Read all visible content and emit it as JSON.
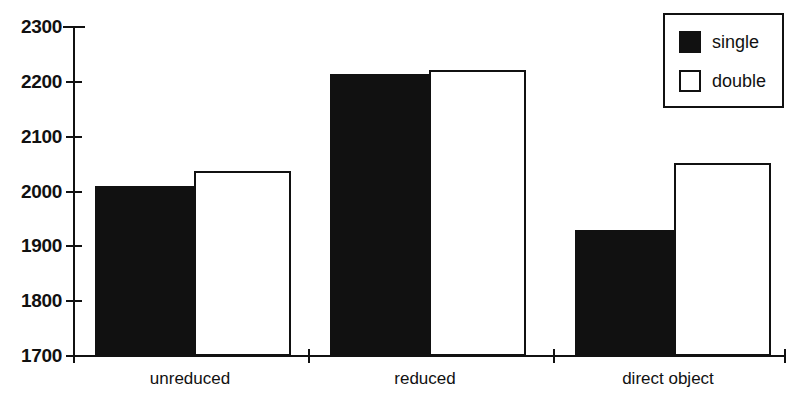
{
  "chart_data": {
    "type": "bar",
    "title": "",
    "subtitle": "",
    "xlabel": "",
    "ylabel": "",
    "categories": [
      "unreduced",
      "reduced",
      "direct object"
    ],
    "series": [
      {
        "name": "single",
        "color": "#111111",
        "values": [
          2010,
          2215,
          1930
        ]
      },
      {
        "name": "double",
        "color": "#ffffff",
        "values": [
          2038,
          2222,
          2052
        ]
      }
    ],
    "ylim": [
      1700,
      2300
    ],
    "ytick_values": [
      1700,
      1800,
      1900,
      2000,
      2100,
      2200,
      2300
    ],
    "ytick_labels": [
      "1700",
      "1800",
      "1900",
      "2000",
      "2100",
      "2200",
      "2300"
    ],
    "grid": false,
    "legend_position": "top-right",
    "legend_entries": [
      "single",
      "double"
    ]
  },
  "axes": {
    "y_axis_name": "y-axis",
    "x_axis_name": "x-axis"
  },
  "legend": {
    "items": [
      {
        "label": "single",
        "swatch": "filled-square-icon"
      },
      {
        "label": "double",
        "swatch": "hollow-square-icon"
      }
    ]
  }
}
